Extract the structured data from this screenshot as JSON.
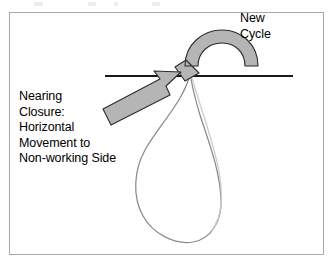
{
  "figure": {
    "background_color": "#ffffff",
    "frame_border_color": "#a8a8a8"
  },
  "annotations": {
    "new_cycle": {
      "lines": [
        "New",
        "Cycle"
      ],
      "text": "New\nCycle"
    },
    "nearing_closure": {
      "lines": [
        "Nearing",
        "Closure:",
        "Horizontal",
        "Movement to",
        "Non-working Side"
      ],
      "text": "Nearing\nClosure:\nHorizontal\nMovement to\nNon-working Side"
    }
  },
  "shapes": {
    "horizontal_reference_line": {
      "name": "horizontal-reference-line",
      "color": "#1a1a1a",
      "x_start": 105,
      "x_end": 293,
      "y": 76
    },
    "loop_path": {
      "name": "swing-loop-path",
      "color": "#7d7d7d",
      "description": "teardrop loop descending from the horizontal line"
    },
    "straight_arrow": {
      "name": "horizontal-movement-arrow",
      "fill": "#b5b5b5",
      "stroke": "#2b2b2b",
      "direction": "up-right"
    },
    "curved_arrow": {
      "name": "new-cycle-curved-arrow",
      "fill": "#b5b5b5",
      "stroke": "#2b2b2b",
      "direction": "counter-clockwise"
    }
  },
  "colors": {
    "text": "#000000",
    "arrow_fill": "#b5b5b5",
    "arrow_stroke": "#2b2b2b",
    "loop_stroke": "#7d7d7d",
    "line_stroke": "#1a1a1a",
    "frame": "#a8a8a8"
  }
}
